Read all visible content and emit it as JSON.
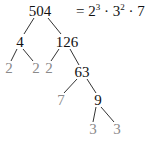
{
  "diagram": {
    "equation": {
      "lhs": "=",
      "terms": [
        {
          "base": "2",
          "exp": "3"
        },
        {
          "sep": "·"
        },
        {
          "base": "3",
          "exp": "2"
        },
        {
          "sep": "·"
        },
        {
          "base": "7",
          "exp": ""
        }
      ]
    },
    "nodes": [
      {
        "id": "n504",
        "label": "504",
        "x": 40,
        "y": 11,
        "kind": "composite"
      },
      {
        "id": "n4",
        "label": "4",
        "x": 20,
        "y": 42,
        "kind": "composite"
      },
      {
        "id": "n126",
        "label": "126",
        "x": 67,
        "y": 42,
        "kind": "composite"
      },
      {
        "id": "n2a",
        "label": "2",
        "x": 9,
        "y": 68,
        "kind": "prime"
      },
      {
        "id": "n2b",
        "label": "2",
        "x": 36,
        "y": 68,
        "kind": "prime"
      },
      {
        "id": "n2c",
        "label": "2",
        "x": 49,
        "y": 68,
        "kind": "prime"
      },
      {
        "id": "n63",
        "label": "63",
        "x": 82,
        "y": 72,
        "kind": "composite"
      },
      {
        "id": "n7",
        "label": "7",
        "x": 61,
        "y": 100,
        "kind": "prime"
      },
      {
        "id": "n9",
        "label": "9",
        "x": 98,
        "y": 100,
        "kind": "composite"
      },
      {
        "id": "n3a",
        "label": "3",
        "x": 93,
        "y": 129,
        "kind": "prime"
      },
      {
        "id": "n3b",
        "label": "3",
        "x": 117,
        "y": 129,
        "kind": "prime"
      }
    ],
    "edges": [
      {
        "from": "n504",
        "to": "n4",
        "x1": 34,
        "y1": 18,
        "x2": 24,
        "y2": 34
      },
      {
        "from": "n504",
        "to": "n126",
        "x1": 48,
        "y1": 18,
        "x2": 61,
        "y2": 34
      },
      {
        "from": "n4",
        "to": "n2a",
        "x1": 17,
        "y1": 49,
        "x2": 11,
        "y2": 61
      },
      {
        "from": "n4",
        "to": "n2b",
        "x1": 23,
        "y1": 49,
        "x2": 33,
        "y2": 61
      },
      {
        "from": "n126",
        "to": "n2c",
        "x1": 59,
        "y1": 49,
        "x2": 51,
        "y2": 61
      },
      {
        "from": "n126",
        "to": "n63",
        "x1": 70,
        "y1": 49,
        "x2": 79,
        "y2": 65
      },
      {
        "from": "n63",
        "to": "n7",
        "x1": 77,
        "y1": 79,
        "x2": 64,
        "y2": 93
      },
      {
        "from": "n63",
        "to": "n9",
        "x1": 87,
        "y1": 79,
        "x2": 96,
        "y2": 93
      },
      {
        "from": "n9",
        "to": "n3a",
        "x1": 96,
        "y1": 107,
        "x2": 93,
        "y2": 122
      },
      {
        "from": "n9",
        "to": "n3b",
        "x1": 101,
        "y1": 107,
        "x2": 114,
        "y2": 122
      }
    ],
    "colors": {
      "composite": "#111111",
      "prime": "#8a8a8a",
      "edge": "#333333"
    }
  }
}
